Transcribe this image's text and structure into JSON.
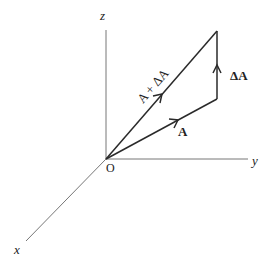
{
  "diagram": {
    "title": "",
    "colors": {
      "axis": "#777777",
      "vector": "#2a2a2a",
      "background": "#ffffff"
    },
    "axes": {
      "z": {
        "label": "z"
      },
      "y": {
        "label": "y"
      },
      "x": {
        "label": "x"
      },
      "origin": {
        "label": "O"
      }
    },
    "vectors": [
      {
        "id": "A",
        "label": "A",
        "bold": true
      },
      {
        "id": "dA",
        "label": "ΔA",
        "bold": true
      },
      {
        "id": "sum",
        "label": "A + ΔA",
        "bold": false
      }
    ]
  }
}
